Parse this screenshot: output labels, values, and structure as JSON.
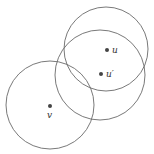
{
  "diagram": {
    "circles": [
      {
        "id": "circle-u",
        "cx": 106,
        "cy": 49,
        "r": 42
      },
      {
        "id": "circle-u-prime",
        "cx": 100,
        "cy": 75,
        "r": 45
      },
      {
        "id": "circle-v",
        "cx": 50,
        "cy": 105,
        "r": 44
      }
    ],
    "points": [
      {
        "id": "u",
        "x": 107,
        "y": 50,
        "label": "u",
        "lx": 112,
        "ly": 53
      },
      {
        "id": "u-prime",
        "x": 101,
        "y": 74,
        "label": "u′",
        "lx": 106,
        "ly": 77
      },
      {
        "id": "v",
        "x": 50,
        "y": 106,
        "label": "v",
        "lx": 47,
        "ly": 118
      }
    ]
  }
}
